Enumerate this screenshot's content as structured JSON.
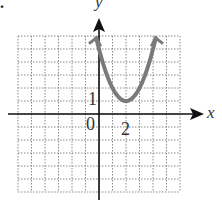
{
  "corner_mark": ".",
  "chart_data": {
    "type": "line",
    "title": "",
    "xlabel": "x",
    "ylabel": "y",
    "xlim": [
      -6,
      6
    ],
    "ylim": [
      -6,
      6
    ],
    "grid": true,
    "grid_style": "dotted",
    "tick_labels": {
      "origin": "0",
      "x": [
        {
          "value": 2,
          "label": "2"
        }
      ],
      "y": [
        {
          "value": 1,
          "label": "1"
        }
      ]
    },
    "series": [
      {
        "name": "parabola",
        "equation": "y = (x - 2)^2 + 1",
        "vertex": [
          2,
          1
        ],
        "x_range": [
          -0.2,
          4.2
        ],
        "arrows_both_ends": true,
        "color": "#7a7a7a",
        "points": [
          [
            -0.2,
            5.84
          ],
          [
            0,
            5
          ],
          [
            0.5,
            3.25
          ],
          [
            1,
            2
          ],
          [
            1.5,
            1.25
          ],
          [
            2,
            1
          ],
          [
            2.5,
            1.25
          ],
          [
            3,
            2
          ],
          [
            3.5,
            3.25
          ],
          [
            4,
            5
          ],
          [
            4.2,
            5.84
          ]
        ]
      }
    ]
  },
  "colors": {
    "axis": "#111111",
    "grid": "#8a8a8a",
    "curve": "#7a7a7a",
    "text": "#333333"
  }
}
